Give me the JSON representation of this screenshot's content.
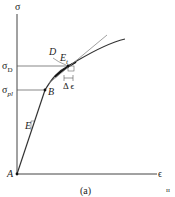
{
  "diagram": {
    "axes": {
      "y_label": "σ",
      "x_label": "ϵ"
    },
    "origin_label": "A",
    "levels": {
      "sigma_D": "σ",
      "sigma_D_sub": "D",
      "sigma_pl": "σ",
      "sigma_pl_sub": "pl"
    },
    "points": {
      "B": "B",
      "D": "D"
    },
    "tangent_label": "E",
    "tangent_sub": "t",
    "strain_increment": "Δ ϵ",
    "elastic_slope": "E",
    "caption": "(a)",
    "corner_mark": "ɪɪ",
    "colors": {
      "line": "#333333",
      "thin": "#888888"
    }
  }
}
